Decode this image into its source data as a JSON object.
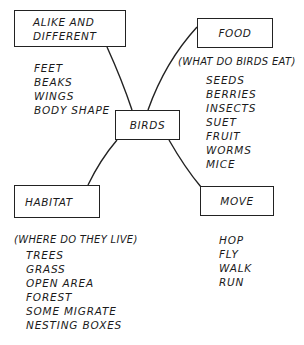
{
  "diagram": {
    "center": {
      "label": "BIRDS"
    },
    "nodes": {
      "alike": {
        "label_lines": [
          "ALIKE AND",
          "DIFFERENT"
        ],
        "items": [
          "FEET",
          "BEAKS",
          "WINGS",
          "BODY SHAPE"
        ]
      },
      "food": {
        "label": "FOOD",
        "subtitle": "(WHAT DO BIRDS EAT)",
        "items": [
          "SEEDS",
          "BERRIES",
          "INSECTS",
          "SUET",
          "FRUIT",
          "WORMS",
          "MICE"
        ]
      },
      "habitat": {
        "label": "HABITAT",
        "subtitle": "(WHERE DO THEY LIVE)",
        "items": [
          "TREES",
          "GRASS",
          "OPEN AREA",
          "FOREST",
          "SOME MIGRATE",
          "NESTING BOXES"
        ]
      },
      "move": {
        "label": "MOVE",
        "items": [
          "HOP",
          "FLY",
          "WALK",
          "RUN"
        ]
      }
    },
    "edges": [
      {
        "from": "BIRDS",
        "to": "ALIKE AND DIFFERENT"
      },
      {
        "from": "BIRDS",
        "to": "FOOD"
      },
      {
        "from": "BIRDS",
        "to": "HABITAT"
      },
      {
        "from": "BIRDS",
        "to": "MOVE"
      }
    ]
  }
}
